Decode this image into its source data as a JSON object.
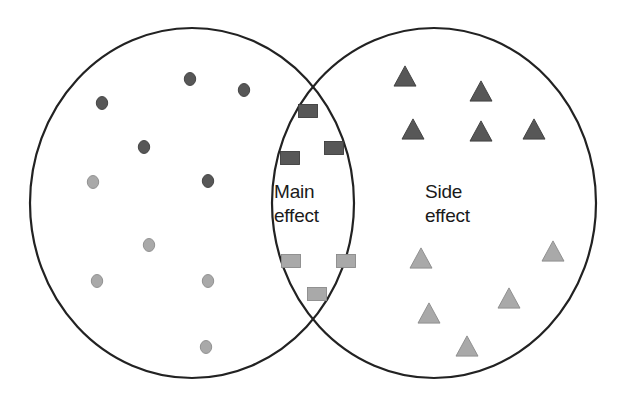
{
  "figure": {
    "type": "venn-diagram",
    "width": 618,
    "height": 400,
    "background_color": "#ffffff",
    "outline_color": "#222222",
    "outline_width": 2
  },
  "labels": {
    "left_overlap_label": "Main\neffect",
    "right_label": "Side\neffect"
  },
  "palette": {
    "dark_gray": "#575757",
    "light_gray": "#a9a9a9",
    "marker_stroke_dark": "#3c3c3c",
    "marker_stroke_light": "#8a8a8a",
    "outline": "#222222",
    "text": "#1a1a1a"
  },
  "sets": {
    "left_circle": {
      "name": "left-set",
      "cx": 192,
      "cy": 203,
      "rx": 162,
      "ry": 175
    },
    "right_circle": {
      "name": "right-set",
      "cx": 434,
      "cy": 203,
      "rx": 162,
      "ry": 175
    }
  },
  "chart_data": {
    "type": "scatter",
    "title": "",
    "xlabel": "",
    "ylabel": "",
    "xlim": [
      0,
      618
    ],
    "ylim": [
      0,
      400
    ],
    "grid": false,
    "legend_position": "none",
    "regions": [
      {
        "id": "left-only",
        "label": "",
        "shape": "circle"
      },
      {
        "id": "overlap",
        "label": "Main effect",
        "shape": "square"
      },
      {
        "id": "right-only",
        "label": "Side effect",
        "shape": "triangle"
      }
    ],
    "series": [
      {
        "name": "left-dark-circles",
        "region": "left-only",
        "marker": "circle",
        "color": "#575757",
        "size": 13,
        "count": 5,
        "points": [
          {
            "x": 190,
            "y": 79
          },
          {
            "x": 244,
            "y": 90
          },
          {
            "x": 102,
            "y": 103
          },
          {
            "x": 144,
            "y": 147
          },
          {
            "x": 208,
            "y": 181
          }
        ]
      },
      {
        "name": "left-light-circles",
        "region": "left-only",
        "marker": "circle",
        "color": "#a9a9a9",
        "size": 13,
        "count": 5,
        "points": [
          {
            "x": 93,
            "y": 182
          },
          {
            "x": 149,
            "y": 245
          },
          {
            "x": 97,
            "y": 281
          },
          {
            "x": 208,
            "y": 281
          },
          {
            "x": 206,
            "y": 347
          }
        ]
      },
      {
        "name": "overlap-dark-squares",
        "region": "overlap",
        "marker": "square",
        "color": "#575757",
        "size": 19,
        "count": 3,
        "points": [
          {
            "x": 308,
            "y": 111
          },
          {
            "x": 334,
            "y": 148
          },
          {
            "x": 290,
            "y": 158
          }
        ]
      },
      {
        "name": "overlap-light-squares",
        "region": "overlap",
        "marker": "square",
        "color": "#a9a9a9",
        "size": 19,
        "count": 3,
        "points": [
          {
            "x": 291,
            "y": 261
          },
          {
            "x": 346,
            "y": 261
          },
          {
            "x": 317,
            "y": 294
          }
        ]
      },
      {
        "name": "right-dark-triangles",
        "region": "right-only",
        "marker": "triangle",
        "color": "#575757",
        "size": 22,
        "count": 5,
        "points": [
          {
            "x": 405,
            "y": 76
          },
          {
            "x": 481,
            "y": 91
          },
          {
            "x": 413,
            "y": 129
          },
          {
            "x": 481,
            "y": 131
          },
          {
            "x": 534,
            "y": 129
          }
        ]
      },
      {
        "name": "right-light-triangles",
        "region": "right-only",
        "marker": "triangle",
        "color": "#a9a9a9",
        "size": 22,
        "count": 5,
        "points": [
          {
            "x": 421,
            "y": 258
          },
          {
            "x": 553,
            "y": 251
          },
          {
            "x": 509,
            "y": 298
          },
          {
            "x": 429,
            "y": 313
          },
          {
            "x": 467,
            "y": 346
          }
        ]
      }
    ]
  }
}
